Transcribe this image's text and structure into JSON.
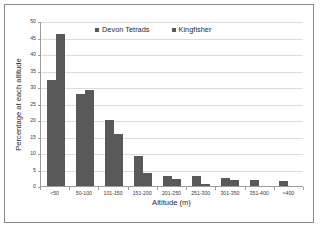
{
  "chart_data": {
    "type": "bar",
    "title": "",
    "xlabel": "Altitude (m)",
    "ylabel": "Percentage at each altitude",
    "categories": [
      "<50",
      "50-100",
      "101-150",
      "151-200",
      "201-250",
      "251-300",
      "301-350",
      "351-400",
      ">400"
    ],
    "series": [
      {
        "name": "Devon Tetrads",
        "color": "#595959",
        "values": [
          32.0,
          27.8,
          20.0,
          9.0,
          3.0,
          3.0,
          2.3,
          1.9,
          1.6
        ]
      },
      {
        "name": "Kingfisher",
        "color": "#595959",
        "values": [
          46.2,
          29.2,
          15.7,
          4.0,
          2.2,
          0.5,
          1.7,
          0.0,
          0.0
        ]
      }
    ],
    "ylim": [
      0,
      50
    ],
    "ytick_labels": [
      "0",
      "5",
      "10",
      "15",
      "20",
      "25",
      "30",
      "35",
      "40",
      "45",
      "50"
    ],
    "ytick_values": [
      0,
      5,
      10,
      15,
      20,
      25,
      30,
      35,
      40,
      45,
      50
    ],
    "grid": true,
    "legend_position": "top-center"
  },
  "legend": {
    "entries": [
      {
        "label": "Devon Tetrads"
      },
      {
        "label": "Kingfisher"
      }
    ]
  },
  "colors": {
    "bar": "#595959",
    "grid": "#dcdcdc",
    "axis": "#9c9c9c",
    "frame": "#8a8a8a",
    "text": "#2b2b2b"
  }
}
